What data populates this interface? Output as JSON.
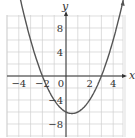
{
  "chart_data": {
    "type": "line",
    "title": "",
    "xlabel": "x",
    "ylabel": "y",
    "xlim": [
      -5,
      5
    ],
    "ylim": [
      -10,
      10
    ],
    "grid": true,
    "x_ticks": [
      "-4",
      "-2",
      "0",
      "2",
      "4"
    ],
    "y_ticks": [
      "8",
      "4",
      "-4",
      "-8"
    ],
    "series": [
      {
        "name": "y = x^2 - x - 6",
        "equation": "y = x^2 - x - 6",
        "x": [
          -4.3,
          -4,
          -3,
          -2,
          -1,
          0,
          0.5,
          1,
          2,
          3,
          4,
          5
        ],
        "values": [
          16.79,
          14,
          6,
          0,
          -4,
          -6,
          -6.25,
          -6,
          -4,
          0,
          6,
          14
        ]
      }
    ],
    "annotations": {
      "x_intercepts": [
        -2,
        3
      ],
      "vertex": [
        0.5,
        -6.25
      ]
    }
  },
  "colors": {
    "grid": "#d0d0d0",
    "axis": "#333333",
    "curve": "#555555"
  }
}
